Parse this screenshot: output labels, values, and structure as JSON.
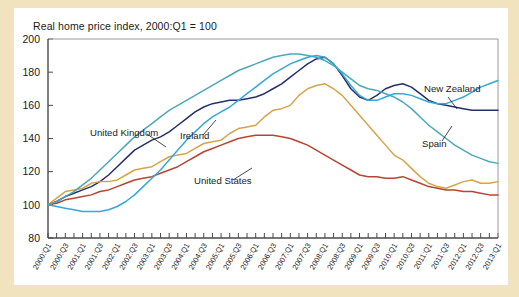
{
  "figure": {
    "background_color": "#f0e3bd",
    "panel_color": "#ffffff",
    "title": "Real home price index, 2000:Q1 = 100"
  },
  "chart_data": {
    "type": "line",
    "title": "Real home price index, 2000:Q1 = 100",
    "xlabel": "",
    "ylabel": "",
    "ylim": [
      80,
      200
    ],
    "yticks": [
      80,
      100,
      120,
      140,
      160,
      180,
      200
    ],
    "ytick_labels": [
      "80",
      "100",
      "120",
      "140",
      "160",
      "180",
      "200"
    ],
    "grid": false,
    "legend_position": "inline-annotations",
    "x": [
      "2000:Q1",
      "2000:Q2",
      "2000:Q3",
      "2000:Q4",
      "2001:Q1",
      "2001:Q2",
      "2001:Q3",
      "2001:Q4",
      "2002:Q1",
      "2002:Q2",
      "2002:Q3",
      "2002:Q4",
      "2003:Q1",
      "2003:Q2",
      "2003:Q3",
      "2003:Q4",
      "2004:Q1",
      "2004:Q2",
      "2004:Q3",
      "2004:Q4",
      "2005:Q1",
      "2005:Q2",
      "2005:Q3",
      "2005:Q4",
      "2006:Q1",
      "2006:Q2",
      "2006:Q3",
      "2006:Q4",
      "2007:Q1",
      "2007:Q2",
      "2007:Q3",
      "2007:Q4",
      "2008:Q1",
      "2008:Q2",
      "2008:Q3",
      "2008:Q4",
      "2009:Q1",
      "2009:Q2",
      "2009:Q3",
      "2009:Q4",
      "2010:Q1",
      "2010:Q2",
      "2010:Q3",
      "2010:Q4",
      "2011:Q1",
      "2011:Q2",
      "2011:Q3",
      "2011:Q4",
      "2012:Q1",
      "2012:Q2",
      "2012:Q3",
      "2012:Q4",
      "2013:Q1"
    ],
    "xtick_labels": [
      "2000:Q1",
      "2000:Q3",
      "2001:Q1",
      "2001:Q3",
      "2002:Q1",
      "2002:Q3",
      "2003:Q1",
      "2003:Q3",
      "2004:Q1",
      "2004:Q3",
      "2005:Q1",
      "2005:Q3",
      "2006:Q1",
      "2006:Q3",
      "2007:Q1",
      "2007:Q3",
      "2008:Q1",
      "2008:Q3",
      "2009:Q1",
      "2009:Q3",
      "2010:Q1",
      "2010:Q3",
      "2011:Q1",
      "2011:Q3",
      "2012:Q1",
      "2012:Q3",
      "2013:Q1"
    ],
    "series": [
      {
        "name": "United Kingdom",
        "color": "#23306b",
        "label_x_px": 76,
        "label_y_px": 128,
        "leader": [
          [
            133,
            126
          ],
          [
            152,
            139
          ]
        ],
        "values": [
          100,
          102,
          105,
          107,
          109,
          111,
          114,
          118,
          123,
          128,
          133,
          136,
          139,
          141,
          144,
          148,
          152,
          156,
          159,
          161,
          162,
          163,
          163,
          164,
          165,
          167,
          170,
          173,
          177,
          181,
          185,
          188,
          189,
          185,
          178,
          170,
          165,
          163,
          166,
          170,
          172,
          173,
          171,
          167,
          163,
          161,
          160,
          159,
          158,
          157,
          157,
          157,
          157
        ]
      },
      {
        "name": "Ireland",
        "color": "#d8a34a",
        "label_x_px": 166,
        "label_y_px": 131,
        "leader": [
          [
            189,
            127
          ],
          [
            202,
            112
          ]
        ],
        "values": [
          100,
          104,
          108,
          109,
          110,
          113,
          114,
          114,
          115,
          118,
          121,
          122,
          123,
          126,
          129,
          130,
          131,
          134,
          137,
          138,
          139,
          143,
          146,
          147,
          148,
          153,
          157,
          158,
          160,
          166,
          170,
          172,
          173,
          170,
          166,
          160,
          154,
          148,
          142,
          136,
          130,
          127,
          122,
          117,
          113,
          111,
          110,
          112,
          114,
          115,
          113,
          113,
          114
        ]
      },
      {
        "name": "United States",
        "color": "#b8452f",
        "label_x_px": 180,
        "label_y_px": 176,
        "leader": [
          [
            219,
            172
          ],
          [
            238,
            160
          ]
        ],
        "values": [
          100,
          101,
          103,
          104,
          105,
          106,
          108,
          109,
          111,
          113,
          115,
          116,
          117,
          119,
          121,
          123,
          126,
          129,
          132,
          134,
          136,
          138,
          140,
          141,
          142,
          142,
          142,
          141,
          140,
          138,
          136,
          133,
          130,
          127,
          124,
          121,
          118,
          117,
          117,
          116,
          116,
          117,
          115,
          113,
          111,
          110,
          109,
          109,
          108,
          108,
          107,
          106,
          106
        ]
      },
      {
        "name": "Spain",
        "color": "#4ca8b8",
        "label_x_px": 408,
        "label_y_px": 139,
        "leader": [
          [
            428,
            133
          ],
          [
            438,
            118
          ]
        ],
        "values": [
          100,
          102,
          105,
          108,
          112,
          116,
          121,
          126,
          131,
          136,
          141,
          145,
          149,
          153,
          157,
          160,
          163,
          166,
          169,
          172,
          175,
          178,
          181,
          183,
          185,
          187,
          189,
          190,
          191,
          191,
          190,
          189,
          187,
          184,
          180,
          176,
          172,
          170,
          169,
          167,
          165,
          162,
          158,
          153,
          148,
          144,
          140,
          136,
          133,
          130,
          128,
          126,
          125
        ]
      },
      {
        "name": "New Zealand",
        "color": "#35a8d8",
        "label_x_px": 410,
        "label_y_px": 84,
        "leader": [
          [
            434,
            89
          ],
          [
            443,
            101
          ]
        ],
        "values": [
          100,
          99,
          98,
          97,
          96,
          96,
          96,
          97,
          99,
          102,
          106,
          111,
          116,
          121,
          127,
          133,
          139,
          144,
          149,
          153,
          156,
          159,
          163,
          167,
          171,
          175,
          179,
          182,
          185,
          187,
          189,
          190,
          189,
          185,
          179,
          172,
          166,
          163,
          163,
          165,
          167,
          167,
          166,
          164,
          162,
          161,
          161,
          163,
          165,
          168,
          171,
          173,
          175
        ]
      }
    ]
  }
}
